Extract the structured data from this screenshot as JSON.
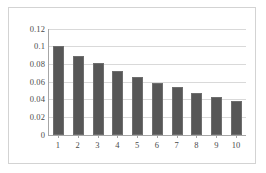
{
  "chart_data": {
    "type": "bar",
    "title": "",
    "subtitle": "",
    "xlabel": "",
    "ylabel": "",
    "categories": [
      "1",
      "2",
      "3",
      "4",
      "5",
      "6",
      "7",
      "8",
      "9",
      "10"
    ],
    "values": [
      0.101,
      0.09,
      0.081,
      0.073,
      0.066,
      0.059,
      0.054,
      0.048,
      0.043,
      0.039
    ],
    "series": [
      {
        "name": "",
        "values": [
          0.101,
          0.09,
          0.081,
          0.073,
          0.066,
          0.059,
          0.054,
          0.048,
          0.043,
          0.039
        ]
      }
    ],
    "ylim": [
      0,
      0.12
    ],
    "yticks": [
      0,
      0.02,
      0.04,
      0.06,
      0.08,
      0.1,
      0.12
    ],
    "ytick_labels": [
      "0",
      "0.02",
      "0.04",
      "0.06",
      "0.08",
      "0.1",
      "0.12"
    ],
    "xtick_labels": [
      "1",
      "2",
      "3",
      "4",
      "5",
      "6",
      "7",
      "8",
      "9",
      "10"
    ],
    "grid": "horizontal",
    "legend": "none",
    "annotations": [],
    "colors": {
      "bar_fill": "#575757",
      "bar_border": "#6e6e6e",
      "gridline": "#d9d9d9",
      "axis_line": "#a6a6a6",
      "frame_border": "#d3d3d3",
      "plot_background": "#ffffff",
      "tick_label": "#4a4a4a"
    }
  }
}
